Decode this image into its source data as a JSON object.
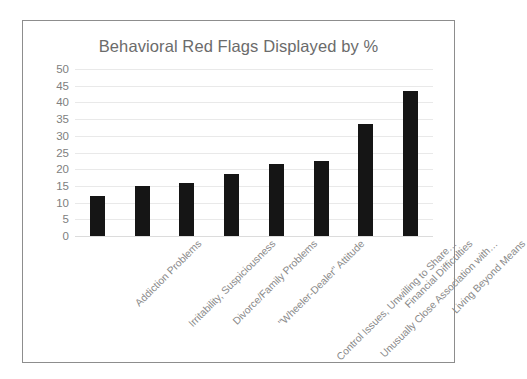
{
  "frame": {
    "border_color": "#8d8d8d",
    "background": "#ffffff"
  },
  "chart_data": {
    "type": "bar",
    "title": "Behavioral Red Flags Displayed by %",
    "xlabel": "",
    "ylabel": "",
    "ylim": [
      0,
      50
    ],
    "ytick_step": 5,
    "yticks": [
      "50",
      "45",
      "40",
      "35",
      "30",
      "25",
      "20",
      "15",
      "10",
      "5",
      "0"
    ],
    "grid": true,
    "legend": "none",
    "bar_color": "#151515",
    "gridline_color": "#e9e9e9",
    "text_color": "#808080",
    "categories": [
      "Addiction Problems",
      "Irritability, Suspiciousness",
      "Divorce/Family Problems",
      "\"Wheeler-Dealer\" Attitude",
      "Control Issues, Unwilling to Share…",
      "Unusually Close Association with…",
      "Financial Difficulties",
      "Living Beyond Means"
    ],
    "values": [
      12,
      15,
      16,
      18.5,
      21.5,
      22.5,
      33.5,
      43.5
    ]
  }
}
